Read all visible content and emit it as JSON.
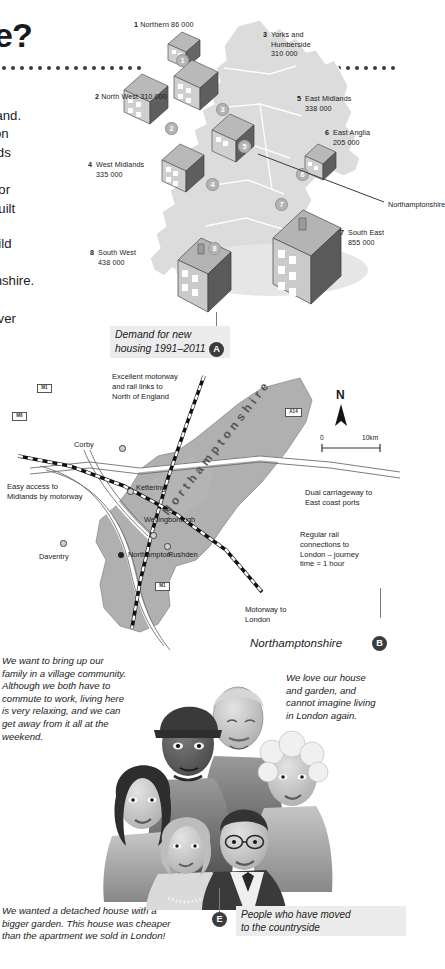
{
  "page": {
    "heading_fragment": "e?",
    "body_paragraphs": [
      "ched\nn England.\nst region\nMidlands\nation.\nmand for\nto be built",
      "e to build\nort\namptonshire.\ne and\nshire over"
    ]
  },
  "uk_map": {
    "caption": "Demand for new\nhousing 1991–2011",
    "caption_badge": "A",
    "pointer_label": "Northamptonshire",
    "regions": [
      {
        "num": "1",
        "name": "Northern",
        "value": "86 000",
        "label": "Northern 86 000"
      },
      {
        "num": "2",
        "name": "North West",
        "value": "310 000",
        "label": "North West 310 000"
      },
      {
        "num": "3",
        "name": "Yorks and Humberside",
        "value": "310 000",
        "label": "Yorks and\nHumberside\n310 000"
      },
      {
        "num": "4",
        "name": "West Midlands",
        "value": "335 000",
        "label": "West Midlands\n335 000"
      },
      {
        "num": "5",
        "name": "East Midlands",
        "value": "338 000",
        "label": "East Midlands\n338 000"
      },
      {
        "num": "6",
        "name": "East Anglia",
        "value": "205 000",
        "label": "East Anglia\n205 000"
      },
      {
        "num": "7",
        "name": "South East",
        "value": "855 000",
        "label": "South East\n855 000"
      },
      {
        "num": "8",
        "name": "South West",
        "value": "438 000",
        "label": "South West\n438 000"
      }
    ]
  },
  "northants_map": {
    "caption": "Northamptonshire",
    "caption_badge": "B",
    "county_label": "Northamptonshire",
    "compass": "N",
    "scale_zero": "0",
    "scale_max": "10km",
    "annotations": [
      {
        "id": "north-links",
        "text": "Excellent motorway\nand rail links to\nNorth of England"
      },
      {
        "id": "midlands-access",
        "text": "Easy access to\nMidlands by motorway"
      },
      {
        "id": "east-ports",
        "text": "Dual carriageway to\nEast coast ports"
      },
      {
        "id": "london-rail",
        "text": "Regular rail\nconnections to\nLondon – journey\ntime = 1 hour"
      },
      {
        "id": "london-motorway",
        "text": "Motorway to\nLondon"
      }
    ],
    "towns": [
      {
        "name": "Corby",
        "type": "town"
      },
      {
        "name": "Kettering",
        "type": "town"
      },
      {
        "name": "Wellingborough",
        "type": "town"
      },
      {
        "name": "Rushden",
        "type": "town"
      },
      {
        "name": "Daventry",
        "type": "town"
      },
      {
        "name": "Northampton",
        "type": "county-town"
      }
    ],
    "motorway_shields": [
      "M1",
      "M6",
      "A14",
      "M1",
      "M1"
    ]
  },
  "people": {
    "caption": "People who have moved\nto the countryside",
    "caption_badge": "E",
    "quotes": [
      {
        "id": "quote-top-left",
        "text": "We want to bring up our\nfamily in a village community.\nAlthough we both have to\ncommute to work, living here\nis very relaxing, and we can\nget away from it all at the\nweekend."
      },
      {
        "id": "quote-top-right",
        "text": "We love our house\nand garden, and\ncannot imagine living\nin London again."
      },
      {
        "id": "quote-bottom-left",
        "text": "We wanted a detached house with a\nbigger garden. This house was cheaper\nthan the apartment we sold in London!"
      }
    ]
  },
  "colors": {
    "land": "#d9d9d9",
    "land_dark": "#b7b7b7",
    "county": "#a9a9a9",
    "badge": "#3c3c3c",
    "caption_bg": "#ececec",
    "roof": "#8c8c8c",
    "wall_light": "#c9c9c9",
    "wall_dark": "#5d5d5d"
  }
}
